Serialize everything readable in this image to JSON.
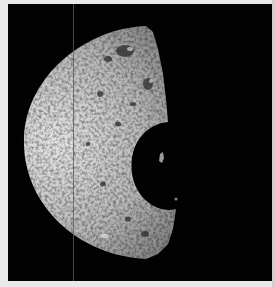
{
  "image": {
    "subject": "cratered moon, crescent-lit, large crater shadow on terminator",
    "colors": {
      "background": "#020202",
      "border": "#e9e9e9",
      "surface_light": "#d8d8d8",
      "surface_dark": "#6a6a6a"
    }
  }
}
